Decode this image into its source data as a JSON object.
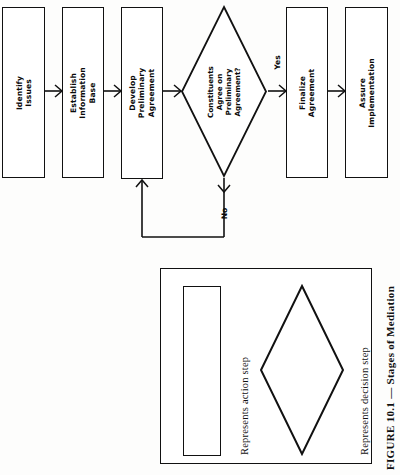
{
  "figure": {
    "caption": "FIGURE 10.1 — Stages of Mediation",
    "orientation": "rotated-90-ccw"
  },
  "flowchart": {
    "nodes": [
      {
        "id": "identify-issues",
        "type": "action",
        "label": "Identify\nIssues"
      },
      {
        "id": "establish-info-base",
        "type": "action",
        "label": "Establish\nInformation\nBase"
      },
      {
        "id": "develop-prelim-agmt",
        "type": "action",
        "label": "Develop\nPreliminary\nAgreement"
      },
      {
        "id": "constituents-agree",
        "type": "decision",
        "label": "Constituents\nAgree on\nPreliminary\nAgreement?"
      },
      {
        "id": "finalize-agreement",
        "type": "action",
        "label": "Finalize\nAgreement"
      },
      {
        "id": "assure-implementation",
        "type": "action",
        "label": "Assure\nImplementation"
      }
    ],
    "edge_labels": {
      "yes": "Yes",
      "no": "No"
    }
  },
  "legend": {
    "action_step": "Represents action step",
    "decision_step": "Represents decision step"
  },
  "colors": {
    "ink": "#111111",
    "paper": "#fdfdfc"
  }
}
